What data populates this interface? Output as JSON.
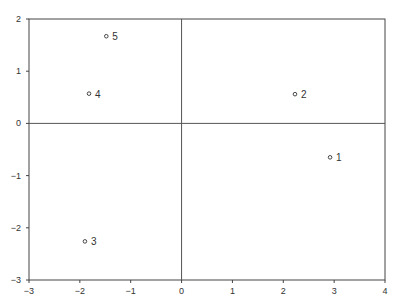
{
  "chart_data": {
    "type": "scatter",
    "title": "",
    "xlabel": "",
    "ylabel": "",
    "xlim": [
      -3,
      4
    ],
    "ylim": [
      -3,
      2
    ],
    "grid": false,
    "reference_lines": {
      "x": 0,
      "y": 0
    },
    "x_ticks": [
      -3,
      -2,
      -1,
      0,
      1,
      2,
      3,
      4
    ],
    "y_ticks": [
      -3,
      -2,
      -1,
      0,
      1,
      2
    ],
    "points": [
      {
        "label": "1",
        "x": 2.92,
        "y": -0.65
      },
      {
        "label": "2",
        "x": 2.23,
        "y": 0.56
      },
      {
        "label": "3",
        "x": -1.9,
        "y": -2.26
      },
      {
        "label": "4",
        "x": -1.82,
        "y": 0.57
      },
      {
        "label": "5",
        "x": -1.48,
        "y": 1.67
      }
    ]
  }
}
